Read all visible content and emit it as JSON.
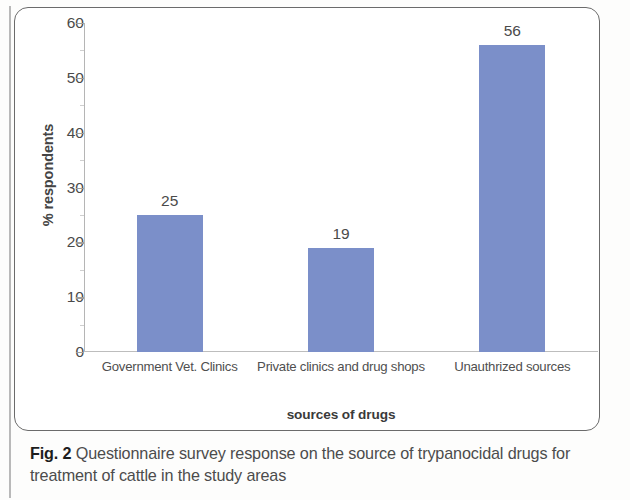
{
  "figure": {
    "caption_label": "Fig. 2",
    "caption_text": "Questionnaire survey response on the source of trypanocidal drugs for treatment of cattle in the study areas"
  },
  "chart_data": {
    "type": "bar",
    "title": "",
    "subtitle": "",
    "xlabel": "sources of drugs",
    "ylabel": "% respondents",
    "categories": [
      "Government Vet. Clinics",
      "Private clinics and drug shops",
      "Unauthrized sources"
    ],
    "values": [
      25,
      19,
      56
    ],
    "value_labels": [
      "25",
      "19",
      "56"
    ],
    "ylim": [
      0,
      60
    ],
    "yticks": [
      0,
      10,
      20,
      30,
      40,
      50,
      60
    ],
    "ytick_labels": [
      "0",
      "10",
      "20",
      "30",
      "40",
      "50",
      "60"
    ],
    "grid": false,
    "legend": false,
    "legend_position": "none",
    "bar_color": "#7b8fc9",
    "axis_color": "#bdbdbd",
    "series": [
      {
        "name": "% respondents",
        "values": [
          25,
          19,
          56
        ]
      }
    ]
  }
}
